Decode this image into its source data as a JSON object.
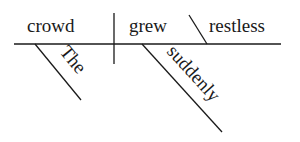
{
  "diagram": {
    "type": "sentence-diagram",
    "sentence": "The crowd suddenly grew restless",
    "subject": "crowd",
    "verb": "grew",
    "predicate_adjective": "restless",
    "modifiers": {
      "subject_modifier": "The",
      "verb_modifier": "suddenly"
    },
    "colors": {
      "ink": "#1a1a1a",
      "background": "#ffffff"
    }
  }
}
